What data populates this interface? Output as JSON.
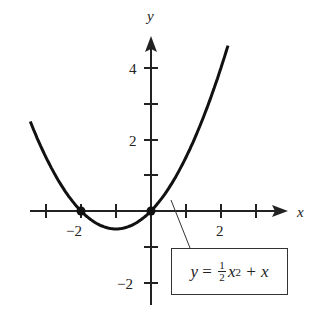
{
  "chart_data": {
    "type": "line",
    "title": "",
    "xlabel": "x",
    "ylabel": "y",
    "function": "y = 1/2 x^2 + x",
    "x_ticks": [
      -3,
      -2,
      -1,
      0,
      1,
      2,
      3
    ],
    "x_tick_labels": [
      {
        "value": -2,
        "label": "−2"
      },
      {
        "value": 2,
        "label": "2"
      }
    ],
    "y_ticks": [
      -2,
      -1,
      1,
      2,
      3,
      4
    ],
    "y_tick_labels": [
      {
        "value": -2,
        "label": "−2"
      },
      {
        "value": 2,
        "label": "2"
      },
      {
        "value": 4,
        "label": "4"
      }
    ],
    "xlim": [
      -3.3,
      3.5
    ],
    "ylim": [
      -2.3,
      4.6
    ],
    "highlighted_points": [
      {
        "x": -2,
        "y": 0
      },
      {
        "x": 0,
        "y": 0
      }
    ],
    "x": [
      -3.2,
      -3,
      -2.5,
      -2,
      -1.5,
      -1,
      -0.5,
      0,
      0.5,
      1,
      1.5,
      2,
      2.3
    ],
    "values": [
      1.92,
      1.5,
      0.625,
      0,
      -0.375,
      -0.5,
      -0.375,
      0,
      0.625,
      1.5,
      2.625,
      4,
      4.945
    ],
    "grid": false,
    "annotation": {
      "text": "y = ½x² + x",
      "points_to": {
        "x": 0.5,
        "y": 0.625
      }
    }
  },
  "labels": {
    "x_axis": "x",
    "y_axis": "y",
    "x_neg2": "−2",
    "x_2": "2",
    "y_4": "4",
    "y_2": "2",
    "y_neg2": "−2",
    "eq_y": "y",
    "eq_equals": " = ",
    "eq_num": "1",
    "eq_den": "2",
    "eq_x": "x",
    "eq_exp": "2",
    "eq_tail": " + x"
  }
}
